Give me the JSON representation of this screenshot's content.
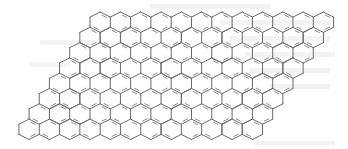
{
  "diagram": {
    "type": "chemical-structure",
    "lattice": {
      "rows": 8,
      "cols_per_row": 12,
      "hex_width": 20.3,
      "hex_radius": 10.2,
      "row_pitch": 15.3,
      "top_row_left_x": 90,
      "top_row_top_y": 12,
      "row_shift_x": -10.15
    },
    "style": {
      "bond_color": "#6b6b6b",
      "bond_width": 1.0,
      "double_bond_color": "#8a8a8a",
      "double_bond_offset": 2.2,
      "background": "#ffffff",
      "ghost_text_color": "#f3f3f3"
    }
  }
}
